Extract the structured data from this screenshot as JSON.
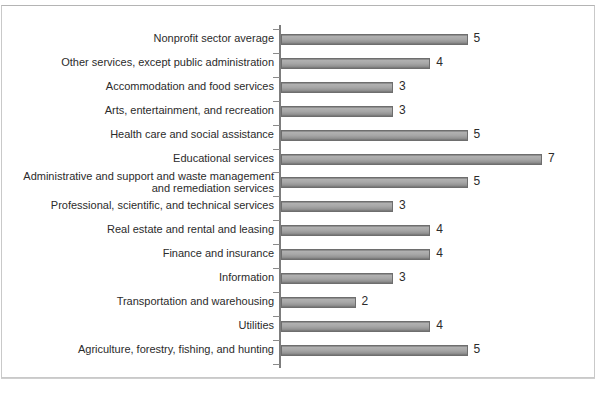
{
  "chart_data": {
    "type": "bar",
    "orientation": "horizontal",
    "title": "",
    "subtitle": "",
    "xlabel": "",
    "ylabel": "",
    "xlim": [
      0,
      8
    ],
    "grid": false,
    "legend": null,
    "value_labels": true,
    "categories": [
      "Nonprofit sector average",
      "Other services, except public administration",
      "Accommodation and food services",
      "Arts, entertainment, and recreation",
      "Health care and social assistance",
      "Educational services",
      "Administrative and support and waste management\nand remediation services",
      "Professional, scientific, and technical services",
      "Real estate and rental and leasing",
      "Finance and insurance",
      "Information",
      "Transportation and warehousing",
      "Utilities",
      "Agriculture, forestry, fishing, and hunting"
    ],
    "values": [
      5,
      4,
      3,
      3,
      5,
      7,
      5,
      3,
      4,
      4,
      3,
      2,
      4,
      5
    ],
    "value_text": [
      "5",
      "4",
      "3",
      "3",
      "5",
      "7",
      "5",
      "3",
      "4",
      "4",
      "3",
      "2",
      "4",
      "5"
    ],
    "bar_color": "#a0a0a0",
    "bar_border_color": "#6e6e6e",
    "axis_color": "#7d7d7d",
    "text_color": "#2b2b2b",
    "frame_color": "#c9c9c9"
  }
}
